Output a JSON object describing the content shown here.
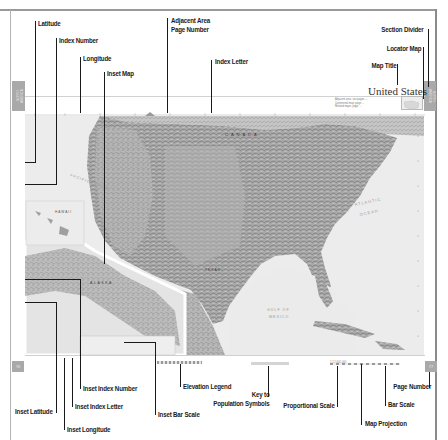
{
  "page": {
    "map_title": "United States",
    "section_tab_text": "NORTH AMERICA",
    "left_page_number": "76",
    "right_page_number": "77",
    "legend_note_lines": [
      "Adjacent area: see pages ...",
      "Continental map: page ...",
      "Related maps: page ..."
    ]
  },
  "map": {
    "water_labels": {
      "pacific": "PACIFIC OCEAN",
      "atlantic_1": "ATLANTIC",
      "atlantic_2": "OCEAN",
      "gulf_1": "GULF OF",
      "gulf_2": "MEXICO",
      "hawaii": "HAWAII",
      "alaska": "ALASKA",
      "canada": "CANADA",
      "texas": "TEXAS"
    },
    "accent_colors": {
      "section_tab": "#a9a9a9",
      "leader_lines": "#1a1a1a",
      "inset_border": "#ffffff"
    }
  },
  "callouts": {
    "top": [
      {
        "id": "latitude",
        "label": "Latitude"
      },
      {
        "id": "index-number",
        "label": "Index Number"
      },
      {
        "id": "longitude",
        "label": "Longitude"
      },
      {
        "id": "inset-map",
        "label": "Inset Map"
      },
      {
        "id": "adjacent-area-page-number",
        "label_line1": "Adjacent Area",
        "label_line2": "Page Number"
      },
      {
        "id": "index-letter",
        "label": "Index Letter"
      },
      {
        "id": "section-divider",
        "label": "Section Divider"
      },
      {
        "id": "locator-map",
        "label": "Locator Map"
      },
      {
        "id": "map-title",
        "label": "Map Title"
      }
    ],
    "bottom": [
      {
        "id": "inset-index-number",
        "label": "Inset Index Number"
      },
      {
        "id": "elevation-legend",
        "label": "Elevation Legend"
      },
      {
        "id": "key-to-population-symbols",
        "label_line1": "Key to",
        "label_line2": "Population Symbols"
      },
      {
        "id": "inset-latitude",
        "label": "Inset Latitude"
      },
      {
        "id": "inset-index-letter",
        "label": "Inset Index Letter"
      },
      {
        "id": "inset-bar-scale",
        "label": "Inset Bar Scale"
      },
      {
        "id": "inset-longitude",
        "label": "Inset Longitude"
      },
      {
        "id": "proportional-scale",
        "label": "Proportional Scale"
      },
      {
        "id": "page-number",
        "label": "Page Number"
      },
      {
        "id": "bar-scale",
        "label": "Bar Scale"
      },
      {
        "id": "map-projection",
        "label": "Map Projection"
      }
    ]
  }
}
